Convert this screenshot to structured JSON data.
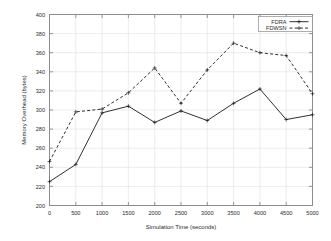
{
  "chart_data": {
    "type": "line",
    "title": "",
    "xlabel": "Simulation Time (seconds)",
    "ylabel": "Memory Overhead (bytes)",
    "x": [
      0,
      500,
      1000,
      1500,
      2000,
      2500,
      3000,
      3500,
      4000,
      4500,
      5000
    ],
    "xlim": [
      0,
      5000
    ],
    "ylim": [
      200,
      400
    ],
    "xticks": [
      "0",
      "500",
      "1000",
      "1500",
      "2000",
      "2500",
      "3000",
      "3500",
      "4000",
      "4500",
      "5000"
    ],
    "yticks": [
      "200",
      "220",
      "240",
      "260",
      "280",
      "300",
      "320",
      "340",
      "360",
      "380",
      "400"
    ],
    "grid": true,
    "legend_position": "top-right",
    "series": [
      {
        "name": "FDRA",
        "style": "solid",
        "marker": "plus",
        "color": "#1a1a1a",
        "values": [
          225,
          243,
          297,
          304,
          287,
          299,
          289,
          307,
          322,
          290,
          295
        ]
      },
      {
        "name": "FDWSN",
        "style": "dashed",
        "marker": "plus",
        "color": "#1a1a1a",
        "values": [
          246,
          298,
          301,
          318,
          344,
          307,
          342,
          370,
          360,
          357,
          317
        ]
      }
    ]
  },
  "legend": {
    "entries": [
      {
        "label": "FDRA"
      },
      {
        "label": "FDWSN"
      }
    ]
  }
}
